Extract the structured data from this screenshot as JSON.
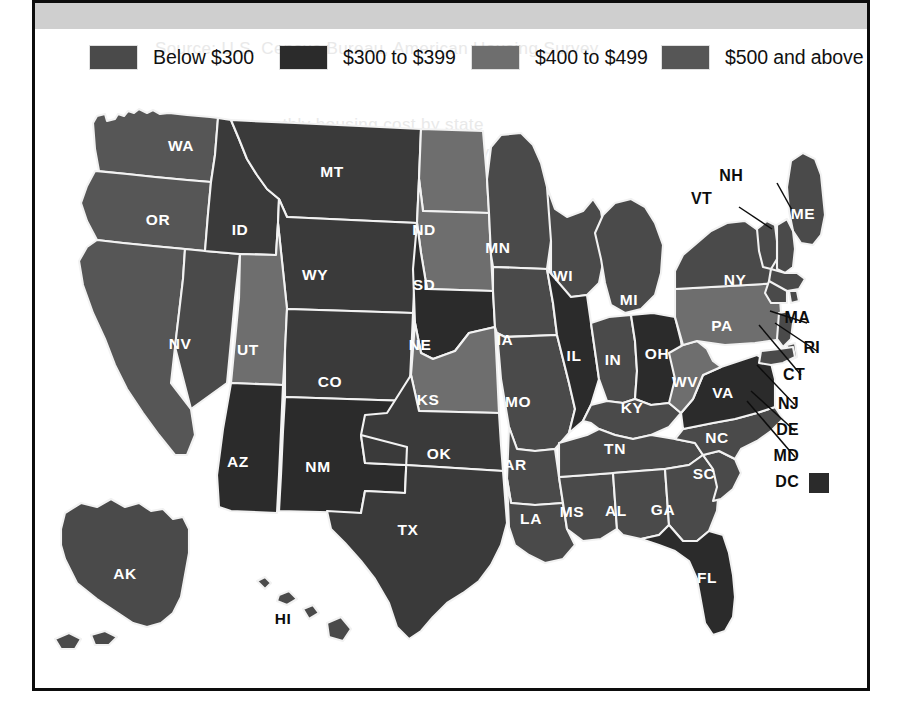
{
  "figure": {
    "kind": "choropleth-map",
    "region": "United States",
    "background_band_color": "#cfcfcf",
    "frame_color": "#0d0d0d",
    "border_color": "#f2f2f2"
  },
  "legend": {
    "items": [
      {
        "label": "Below $300",
        "color": "#4a4a4a",
        "x": 55
      },
      {
        "label": "$300 to $399",
        "color": "#2b2b2b",
        "x": 245
      },
      {
        "label": "$400 to $499",
        "color": "#6e6e6e",
        "x": 437
      },
      {
        "label": "$500 and above",
        "color": "#565656",
        "x": 627
      }
    ]
  },
  "ghost_text": [
    {
      "text": "Source: U.S. Census Bureau, American Housing Survey",
      "x": 120,
      "y": 36
    },
    {
      "text": "median monthly housing cost by state",
      "x": 150,
      "y": 112
    },
    {
      "text": "costs vary widely across the country",
      "x": 168,
      "y": 140
    }
  ],
  "map": {
    "dc_marker_color": "#2b2b2b",
    "states": [
      {
        "code": "WA",
        "name": "Washington",
        "bucket": 3,
        "color": "#565656",
        "lx": 146,
        "ly": 64,
        "label_fill": "light"
      },
      {
        "code": "OR",
        "name": "Oregon",
        "bucket": 3,
        "color": "#565656",
        "lx": 123,
        "ly": 138,
        "label_fill": "light"
      },
      {
        "code": "CA",
        "name": "California",
        "bucket": 3,
        "color": "#565656",
        "lx": 78,
        "ly": 310,
        "label_fill": "light"
      },
      {
        "code": "NV",
        "name": "Nevada",
        "bucket": 3,
        "color": "#4a4a4a",
        "lx": 145,
        "ly": 262,
        "label_fill": "light"
      },
      {
        "code": "ID",
        "name": "Idaho",
        "bucket": 1,
        "color": "#3a3a3a",
        "lx": 205,
        "ly": 148,
        "label_fill": "light"
      },
      {
        "code": "MT",
        "name": "Montana",
        "bucket": 1,
        "color": "#3a3a3a",
        "lx": 297,
        "ly": 90,
        "label_fill": "light"
      },
      {
        "code": "WY",
        "name": "Wyoming",
        "bucket": 1,
        "color": "#3a3a3a",
        "lx": 280,
        "ly": 193,
        "label_fill": "light"
      },
      {
        "code": "UT",
        "name": "Utah",
        "bucket": 2,
        "color": "#6e6e6e",
        "lx": 213,
        "ly": 268,
        "label_fill": "light"
      },
      {
        "code": "AZ",
        "name": "Arizona",
        "bucket": 1,
        "color": "#2b2b2b",
        "lx": 203,
        "ly": 380,
        "label_fill": "light"
      },
      {
        "code": "CO",
        "name": "Colorado",
        "bucket": 1,
        "color": "#3a3a3a",
        "lx": 295,
        "ly": 300,
        "label_fill": "light"
      },
      {
        "code": "NM",
        "name": "New Mexico",
        "bucket": 1,
        "color": "#2b2b2b",
        "lx": 283,
        "ly": 385,
        "label_fill": "light"
      },
      {
        "code": "ND",
        "name": "North Dakota",
        "bucket": 2,
        "color": "#6e6e6e",
        "lx": 389,
        "ly": 148,
        "label_fill": "light"
      },
      {
        "code": "SD",
        "name": "South Dakota",
        "bucket": 2,
        "color": "#6e6e6e",
        "lx": 389,
        "ly": 203,
        "label_fill": "light"
      },
      {
        "code": "NE",
        "name": "Nebraska",
        "bucket": 1,
        "color": "#2b2b2b",
        "lx": 385,
        "ly": 263,
        "label_fill": "light"
      },
      {
        "code": "KS",
        "name": "Kansas",
        "bucket": 2,
        "color": "#6e6e6e",
        "lx": 393,
        "ly": 318,
        "label_fill": "light"
      },
      {
        "code": "OK",
        "name": "Oklahoma",
        "bucket": 1,
        "color": "#3a3a3a",
        "lx": 404,
        "ly": 372,
        "label_fill": "light"
      },
      {
        "code": "TX",
        "name": "Texas",
        "bucket": 1,
        "color": "#3a3a3a",
        "lx": 373,
        "ly": 448,
        "label_fill": "light"
      },
      {
        "code": "MN",
        "name": "Minnesota",
        "bucket": 3,
        "color": "#4a4a4a",
        "lx": 463,
        "ly": 166,
        "label_fill": "light"
      },
      {
        "code": "IA",
        "name": "Iowa",
        "bucket": 3,
        "color": "#4a4a4a",
        "lx": 470,
        "ly": 258,
        "label_fill": "light"
      },
      {
        "code": "MO",
        "name": "Missouri",
        "bucket": 3,
        "color": "#4a4a4a",
        "lx": 483,
        "ly": 320,
        "label_fill": "light"
      },
      {
        "code": "AR",
        "name": "Arkansas",
        "bucket": 3,
        "color": "#4a4a4a",
        "lx": 480,
        "ly": 383,
        "label_fill": "light"
      },
      {
        "code": "LA",
        "name": "Louisiana",
        "bucket": 3,
        "color": "#4a4a4a",
        "lx": 496,
        "ly": 437,
        "label_fill": "light"
      },
      {
        "code": "WI",
        "name": "Wisconsin",
        "bucket": 3,
        "color": "#4a4a4a",
        "lx": 528,
        "ly": 194,
        "label_fill": "light"
      },
      {
        "code": "IL",
        "name": "Illinois",
        "bucket": 1,
        "color": "#2b2b2b",
        "lx": 539,
        "ly": 274,
        "label_fill": "light"
      },
      {
        "code": "MS",
        "name": "Mississippi",
        "bucket": 3,
        "color": "#4a4a4a",
        "lx": 537,
        "ly": 430,
        "label_fill": "light"
      },
      {
        "code": "MI",
        "name": "Michigan",
        "bucket": 3,
        "color": "#4a4a4a",
        "lx": 594,
        "ly": 218,
        "label_fill": "light"
      },
      {
        "code": "IN",
        "name": "Indiana",
        "bucket": 3,
        "color": "#4a4a4a",
        "lx": 578,
        "ly": 278,
        "label_fill": "light"
      },
      {
        "code": "OH",
        "name": "Ohio",
        "bucket": 1,
        "color": "#2b2b2b",
        "lx": 622,
        "ly": 272,
        "label_fill": "light"
      },
      {
        "code": "KY",
        "name": "Kentucky",
        "bucket": 3,
        "color": "#4a4a4a",
        "lx": 597,
        "ly": 326,
        "label_fill": "light"
      },
      {
        "code": "TN",
        "name": "Tennessee",
        "bucket": 3,
        "color": "#4a4a4a",
        "lx": 580,
        "ly": 367,
        "label_fill": "light"
      },
      {
        "code": "AL",
        "name": "Alabama",
        "bucket": 3,
        "color": "#4a4a4a",
        "lx": 581,
        "ly": 429,
        "label_fill": "light"
      },
      {
        "code": "GA",
        "name": "Georgia",
        "bucket": 3,
        "color": "#4a4a4a",
        "lx": 628,
        "ly": 428,
        "label_fill": "light"
      },
      {
        "code": "FL",
        "name": "Florida",
        "bucket": 1,
        "color": "#2b2b2b",
        "lx": 672,
        "ly": 496,
        "label_fill": "light"
      },
      {
        "code": "SC",
        "name": "South Carolina",
        "bucket": 3,
        "color": "#4a4a4a",
        "lx": 669,
        "ly": 392,
        "label_fill": "light"
      },
      {
        "code": "NC",
        "name": "North Carolina",
        "bucket": 3,
        "color": "#4a4a4a",
        "lx": 682,
        "ly": 356,
        "label_fill": "light"
      },
      {
        "code": "VA",
        "name": "Virginia",
        "bucket": 1,
        "color": "#2b2b2b",
        "lx": 688,
        "ly": 311,
        "label_fill": "light"
      },
      {
        "code": "WV",
        "name": "West Virginia",
        "bucket": 2,
        "color": "#6e6e6e",
        "lx": 650,
        "ly": 300,
        "label_fill": "light"
      },
      {
        "code": "PA",
        "name": "Pennsylvania",
        "bucket": 2,
        "color": "#6e6e6e",
        "lx": 687,
        "ly": 244,
        "label_fill": "light"
      },
      {
        "code": "NY",
        "name": "New York",
        "bucket": 3,
        "color": "#4a4a4a",
        "lx": 700,
        "ly": 198,
        "label_fill": "light"
      },
      {
        "code": "ME",
        "name": "Maine",
        "bucket": 3,
        "color": "#4a4a4a",
        "lx": 768,
        "ly": 132,
        "label_fill": "light"
      },
      {
        "code": "AK",
        "name": "Alaska",
        "bucket": 3,
        "color": "#4a4a4a",
        "lx": 90,
        "ly": 492,
        "label_fill": "light"
      },
      {
        "code": "HI",
        "name": "Hawaii",
        "bucket": 3,
        "color": "#4a4a4a",
        "lx": 248,
        "ly": 537,
        "label_fill": "dark"
      }
    ],
    "callouts": [
      {
        "code": "NH",
        "name": "New Hampshire",
        "tx": 708,
        "ty": 94,
        "path": "M 742 100 L 762 136"
      },
      {
        "code": "VT",
        "name": "Vermont",
        "tx": 677,
        "ty": 117,
        "path": "M 704 124 L 737 146"
      },
      {
        "code": "MA",
        "name": "Massachusetts",
        "tx": 775,
        "ty": 236,
        "path": "M 772 240 L 735 228"
      },
      {
        "code": "RI",
        "name": "Rhode Island",
        "tx": 785,
        "ty": 266,
        "path": "M 782 268 L 740 240"
      },
      {
        "code": "CT",
        "name": "Connecticut",
        "tx": 770,
        "ty": 293,
        "path": "M 766 292 L 724 242"
      },
      {
        "code": "NJ",
        "name": "New Jersey",
        "tx": 764,
        "ty": 322,
        "path": "M 760 322 L 722 282"
      },
      {
        "code": "DE",
        "name": "Delaware",
        "tx": 764,
        "ty": 348,
        "path": "M 760 348 L 716 308"
      },
      {
        "code": "MD",
        "name": "Maryland",
        "tx": 764,
        "ty": 374,
        "path": "M 760 374 L 712 318"
      },
      {
        "code": "DC",
        "name": "District of Columbia",
        "tx": 764,
        "ty": 400,
        "path": ""
      }
    ]
  }
}
